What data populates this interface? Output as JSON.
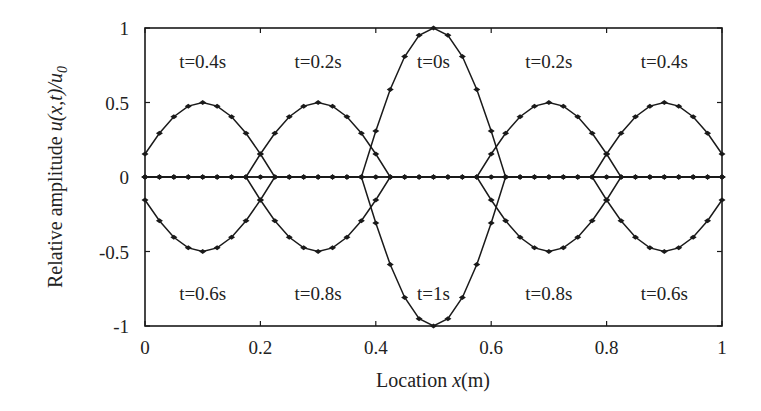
{
  "chart_data": {
    "type": "line",
    "title": "",
    "xlabel": "Location x(m)",
    "xlabel_parts": {
      "pre": "Location ",
      "var": "x",
      "post": "(m)"
    },
    "ylabel": "Relative amplitude u(x,t)/u0",
    "ylabel_parts": {
      "pre": "Relative amplitude ",
      "var": "u(x,t)/u",
      "sub": "0"
    },
    "xlim": [
      0,
      1
    ],
    "ylim": [
      -1,
      1
    ],
    "xticks": [
      0,
      0.2,
      0.4,
      0.6,
      0.8,
      1
    ],
    "xtick_labels": [
      "0",
      "0.2",
      "0.4",
      "0.6",
      "0.8",
      "1"
    ],
    "yticks": [
      1,
      0.5,
      0,
      -0.5,
      -1
    ],
    "ytick_labels": [
      "1",
      "0.5",
      "0",
      "-0.5",
      "-1"
    ],
    "grid": false,
    "legend": null,
    "line_color": "#1a1a1a",
    "marker": "diamond",
    "pulse": {
      "half_width": 0.125,
      "shape": "half-sine"
    },
    "series": [
      {
        "name": "t=0s",
        "time": 0.0,
        "pulses": [
          {
            "center": 0.5,
            "amplitude": 1.0
          }
        ]
      },
      {
        "name": "t=0.2s",
        "time": 0.2,
        "pulses": [
          {
            "center": 0.3,
            "amplitude": 0.5
          },
          {
            "center": 0.7,
            "amplitude": 0.5
          }
        ]
      },
      {
        "name": "t=0.4s",
        "time": 0.4,
        "pulses": [
          {
            "center": 0.1,
            "amplitude": 0.5
          },
          {
            "center": 0.9,
            "amplitude": 0.5
          }
        ]
      },
      {
        "name": "t=0.6s",
        "time": 0.6,
        "pulses": [
          {
            "center": 0.1,
            "amplitude": -0.5
          },
          {
            "center": 0.9,
            "amplitude": -0.5
          }
        ]
      },
      {
        "name": "t=0.8s",
        "time": 0.8,
        "pulses": [
          {
            "center": 0.3,
            "amplitude": -0.5
          },
          {
            "center": 0.7,
            "amplitude": -0.5
          }
        ]
      },
      {
        "name": "t=1s",
        "time": 1.0,
        "pulses": [
          {
            "center": 0.5,
            "amplitude": -1.0
          }
        ]
      }
    ],
    "peak_points": [
      {
        "series": "t=0s",
        "x": 0.5,
        "y": 1.0
      },
      {
        "series": "t=0.2s",
        "x": 0.3,
        "y": 0.5
      },
      {
        "series": "t=0.2s",
        "x": 0.7,
        "y": 0.5
      },
      {
        "series": "t=0.4s",
        "x": 0.1,
        "y": 0.5
      },
      {
        "series": "t=0.4s",
        "x": 0.9,
        "y": 0.5
      },
      {
        "series": "t=0.6s",
        "x": 0.1,
        "y": -0.5
      },
      {
        "series": "t=0.6s",
        "x": 0.9,
        "y": -0.5
      },
      {
        "series": "t=0.8s",
        "x": 0.3,
        "y": -0.5
      },
      {
        "series": "t=0.8s",
        "x": 0.7,
        "y": -0.5
      },
      {
        "series": "t=1s",
        "x": 0.5,
        "y": -1.0
      }
    ],
    "annotations": [
      {
        "text": "t=0.4s",
        "x": 0.1,
        "y": 0.78
      },
      {
        "text": "t=0.2s",
        "x": 0.3,
        "y": 0.78
      },
      {
        "text": "t=0s",
        "x": 0.5,
        "y": 0.78
      },
      {
        "text": "t=0.2s",
        "x": 0.7,
        "y": 0.78
      },
      {
        "text": "t=0.4s",
        "x": 0.9,
        "y": 0.78
      },
      {
        "text": "t=0.6s",
        "x": 0.1,
        "y": -0.78
      },
      {
        "text": "t=0.8s",
        "x": 0.3,
        "y": -0.78
      },
      {
        "text": "t=1s",
        "x": 0.5,
        "y": -0.78
      },
      {
        "text": "t=0.8s",
        "x": 0.7,
        "y": -0.78
      },
      {
        "text": "t=0.6s",
        "x": 0.9,
        "y": -0.78
      }
    ]
  }
}
